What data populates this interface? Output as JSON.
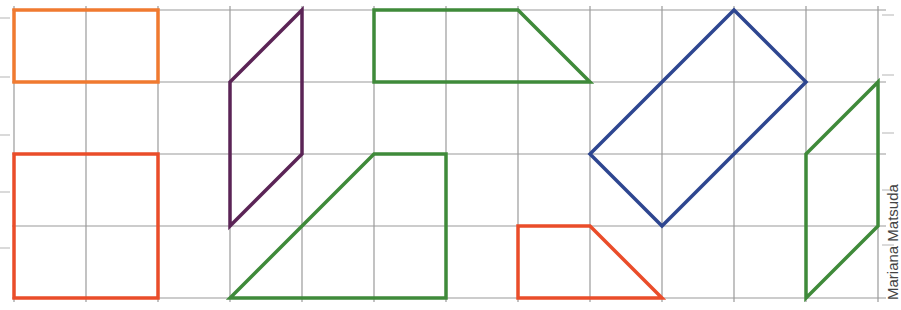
{
  "grid": {
    "origin_x": 14,
    "origin_y": 10,
    "cell": 72,
    "cols": 12,
    "rows": 4,
    "line_color": "#9a9a9a"
  },
  "colors": {
    "orange": "#f07a30",
    "red_orange": "#ea4d2a",
    "purple": "#5b2456",
    "green": "#3f8a3a",
    "blue": "#2e4690"
  },
  "shapes": [
    {
      "name": "orange-rectangle",
      "color": "#f07a30",
      "points": [
        [
          0,
          0
        ],
        [
          2,
          0
        ],
        [
          2,
          1
        ],
        [
          0,
          1
        ]
      ]
    },
    {
      "name": "red-square",
      "color": "#ea4d2a",
      "points": [
        [
          0,
          2
        ],
        [
          2,
          2
        ],
        [
          2,
          4
        ],
        [
          0,
          4
        ]
      ]
    },
    {
      "name": "purple-parallelogram",
      "color": "#5b2456",
      "points": [
        [
          4,
          0
        ],
        [
          4,
          2
        ],
        [
          3,
          3
        ],
        [
          3,
          1
        ]
      ]
    },
    {
      "name": "green-trapezoid-top",
      "color": "#3f8a3a",
      "points": [
        [
          5,
          0
        ],
        [
          7,
          0
        ],
        [
          8,
          1
        ],
        [
          5,
          1
        ]
      ]
    },
    {
      "name": "green-trapezoid-bottom",
      "color": "#3f8a3a",
      "points": [
        [
          5,
          2
        ],
        [
          6,
          2
        ],
        [
          6,
          4
        ],
        [
          3,
          4
        ]
      ]
    },
    {
      "name": "blue-rotated-rectangle",
      "color": "#2e4690",
      "points": [
        [
          10,
          0
        ],
        [
          11,
          1
        ],
        [
          9,
          3
        ],
        [
          8,
          2
        ]
      ]
    },
    {
      "name": "red-trapezoid",
      "color": "#ea4d2a",
      "points": [
        [
          7,
          3
        ],
        [
          8,
          3
        ],
        [
          9,
          4
        ],
        [
          7,
          4
        ]
      ]
    },
    {
      "name": "green-parallelogram-right",
      "color": "#3f8a3a",
      "points": [
        [
          12,
          1
        ],
        [
          12,
          3
        ],
        [
          11,
          4
        ],
        [
          11,
          2
        ]
      ]
    }
  ],
  "edge_ticks": {
    "left_y": [
      18,
      77,
      135,
      192,
      248
    ],
    "right_y": [
      15,
      75,
      133,
      190,
      245
    ]
  },
  "credit": {
    "text": "Mariana Matsuda"
  }
}
